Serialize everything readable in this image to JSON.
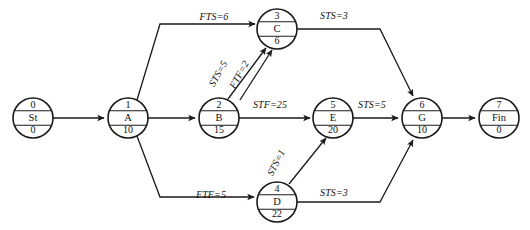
{
  "diagram": {
    "type": "activity-on-node-network",
    "title": "",
    "width": 530,
    "height": 230,
    "background_color": "#ffffff",
    "line_color": "#1a1a1a",
    "nodes": [
      {
        "id": "n0",
        "number": "0",
        "name": "St",
        "duration": "0",
        "cx": 33,
        "cy": 118,
        "r": 20
      },
      {
        "id": "n1",
        "number": "1",
        "name": "A",
        "duration": "10",
        "cx": 128,
        "cy": 118,
        "r": 20
      },
      {
        "id": "n2",
        "number": "2",
        "name": "B",
        "duration": "15",
        "cx": 219,
        "cy": 118,
        "r": 20
      },
      {
        "id": "n3",
        "number": "3",
        "name": "C",
        "duration": "6",
        "cx": 277,
        "cy": 29,
        "r": 20
      },
      {
        "id": "n4",
        "number": "4",
        "name": "D",
        "duration": "22",
        "cx": 277,
        "cy": 202,
        "r": 20
      },
      {
        "id": "n5",
        "number": "5",
        "name": "E",
        "duration": "20",
        "cx": 333,
        "cy": 118,
        "r": 20
      },
      {
        "id": "n6",
        "number": "6",
        "name": "G",
        "duration": "10",
        "cx": 422,
        "cy": 118,
        "r": 20
      },
      {
        "id": "n7",
        "number": "7",
        "name": "Fin",
        "duration": "0",
        "cx": 499,
        "cy": 118,
        "r": 20
      }
    ],
    "edges": [
      {
        "id": "e0",
        "from": "n0",
        "to": "n1",
        "label": "",
        "label_x": 0,
        "label_y": 0,
        "rotation": 0,
        "path": "M 53 118 L 104 118"
      },
      {
        "id": "e1",
        "from": "n1",
        "to": "n3",
        "label": "FTS=6",
        "label_x": 214,
        "label_y": 18,
        "rotation": 0,
        "path": "M 137 100 L 160 24 L 255 24"
      },
      {
        "id": "e2",
        "from": "n1",
        "to": "n2",
        "label": "",
        "label_x": 0,
        "label_y": 0,
        "rotation": 0,
        "path": "M 148 118 L 195 118"
      },
      {
        "id": "e3",
        "from": "n1",
        "to": "n4",
        "label": "FTF=5",
        "label_x": 211,
        "label_y": 196,
        "rotation": 0,
        "path": "M 137 136 L 160 197 L 254 197"
      },
      {
        "id": "e4",
        "from": "n2",
        "to": "n3",
        "label": "STS=5",
        "label_x": 219,
        "label_y": 74,
        "rotation": -61,
        "path": "M 228 99 L 266 48"
      },
      {
        "id": "e5",
        "from": "n2",
        "to": "n3",
        "label": "FTF=2",
        "label_x": 240,
        "label_y": 75,
        "rotation": -61,
        "path": "M 240 100 L 272 50"
      },
      {
        "id": "e6",
        "from": "n2",
        "to": "n5",
        "label": "STF=25",
        "label_x": 270,
        "label_y": 106,
        "rotation": 0,
        "path": "M 239 118 L 310 118"
      },
      {
        "id": "e7",
        "from": "n3",
        "to": "n6",
        "label": "STS=3",
        "label_x": 334,
        "label_y": 17,
        "rotation": 0,
        "path": "M 297 29 L 380 29 L 413 96"
      },
      {
        "id": "e8",
        "from": "n4",
        "to": "n5",
        "label": "STS=1",
        "label_x": 277,
        "label_y": 163,
        "rotation": -63,
        "path": "M 289 184 L 326 138"
      },
      {
        "id": "e9",
        "from": "n4",
        "to": "n6",
        "label": "STS=3",
        "label_x": 334,
        "label_y": 194,
        "rotation": 0,
        "path": "M 297 202 L 380 202 L 413 140"
      },
      {
        "id": "e10",
        "from": "n5",
        "to": "n6",
        "label": "STS=5",
        "label_x": 372,
        "label_y": 106,
        "rotation": 0,
        "path": "M 353 118 L 398 118"
      },
      {
        "id": "e11",
        "from": "n6",
        "to": "n7",
        "label": "",
        "label_x": 0,
        "label_y": 0,
        "rotation": 0,
        "path": "M 442 118 L 475 118"
      }
    ]
  }
}
